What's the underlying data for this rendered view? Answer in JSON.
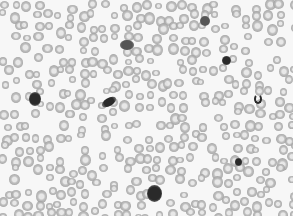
{
  "image": {
    "description": "Grayscale micrograph of a peripheral blood smear showing numerous red blood cells with several dark-stained white blood cells",
    "width": 293,
    "height": 216,
    "background": "#f7f7f7",
    "rbc_color": "#a8a8a8",
    "wbc_color": "#2a2a2a",
    "wbc": [
      {
        "x": 29,
        "y": 92,
        "w": 12,
        "h": 14,
        "type": "lymphocyte"
      },
      {
        "x": 101,
        "y": 98,
        "w": 16,
        "h": 8,
        "type": "elongated-nucleus"
      },
      {
        "x": 120,
        "y": 40,
        "w": 14,
        "h": 10,
        "type": "smudged"
      },
      {
        "x": 200,
        "y": 16,
        "w": 10,
        "h": 10,
        "type": "smudged"
      },
      {
        "x": 222,
        "y": 56,
        "w": 9,
        "h": 9,
        "type": "small-dark-round"
      },
      {
        "x": 254,
        "y": 94,
        "w": 8,
        "h": 10,
        "type": "band-neutrophil"
      },
      {
        "x": 235,
        "y": 158,
        "w": 7,
        "h": 8,
        "type": "small-dark-round"
      },
      {
        "x": 147,
        "y": 185,
        "w": 15,
        "h": 17,
        "type": "large-dark"
      }
    ]
  }
}
